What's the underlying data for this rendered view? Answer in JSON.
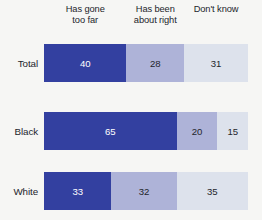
{
  "chart_data": {
    "type": "bar",
    "subtype": "stacked-horizontal-100",
    "title": "",
    "xlabel": "",
    "ylabel": "",
    "xlim": [
      0,
      100
    ],
    "grid": false,
    "legend_position": "top",
    "categories": [
      "Total",
      "Black",
      "White"
    ],
    "series": [
      {
        "name": "Has gone too far",
        "values": [
          40,
          65,
          33
        ],
        "color": "#3340a0"
      },
      {
        "name": "Has been about right",
        "values": [
          28,
          20,
          32
        ],
        "color": "#aeb3d8"
      },
      {
        "name": "Don't know",
        "values": [
          31,
          15,
          35
        ],
        "color": "#dde2ec"
      }
    ],
    "legend_lines": [
      [
        "Has gone",
        "too far"
      ],
      [
        "Has been",
        "about right"
      ],
      [
        "Don't know",
        ""
      ]
    ],
    "rows": [
      {
        "label": "Total",
        "values": [
          40,
          28,
          31
        ]
      },
      {
        "label": "Black",
        "values": [
          65,
          20,
          15
        ]
      },
      {
        "label": "White",
        "values": [
          33,
          32,
          35
        ]
      }
    ]
  },
  "colors": {
    "background": "#f6f6f4",
    "segment_1": "#3340a0",
    "segment_2": "#aeb3d8",
    "segment_3": "#dde2ec",
    "text": "#23252b",
    "text_on_dark": "#ffffff"
  }
}
